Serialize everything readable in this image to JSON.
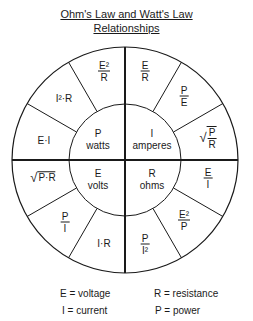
{
  "title": {
    "line1": "Ohm's Law and Watt's Law",
    "line2": "Relationships"
  },
  "center": {
    "P": {
      "symbol": "P",
      "unit": "watts"
    },
    "I": {
      "symbol": "I",
      "unit": "amperes"
    },
    "E": {
      "symbol": "E",
      "unit": "volts"
    },
    "R": {
      "symbol": "R",
      "unit": "ohms"
    }
  },
  "formulas": {
    "p1": "E·I",
    "p2": "I²·R",
    "p3_num": "E²",
    "p3_den": "R",
    "i1_num": "E",
    "i1_den": "R",
    "i2_num": "P",
    "i2_den": "E",
    "i3_num": "P",
    "i3_den": "R",
    "r1_num": "E",
    "r1_den": "I",
    "r2_num": "E²",
    "r2_den": "P",
    "r3_num": "P",
    "r3_den": "I²",
    "e1": "I·R",
    "e2_num": "P",
    "e2_den": "I",
    "e3": "P·R"
  },
  "legend": {
    "E": "E = voltage",
    "R": "R = resistance",
    "I": "I = current",
    "P": "P = power"
  }
}
